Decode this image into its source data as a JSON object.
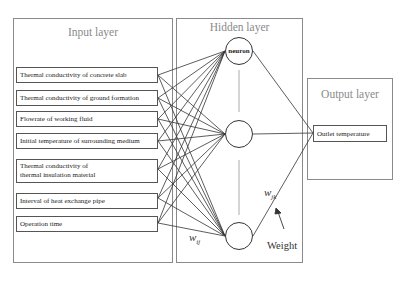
{
  "diagram": {
    "type": "neural-network",
    "layers": {
      "input": {
        "title": "Input layer",
        "nodes": [
          {
            "label": "Thermal conductivity of concrete slab"
          },
          {
            "label": "Thermal conductivity of ground formation"
          },
          {
            "label": "Flowrate of working fluid"
          },
          {
            "label": "Initial temperature of surrounding medium"
          },
          {
            "label": "Thermal conductivity of",
            "label2": "thermal insulation material"
          },
          {
            "label": "Interval of heat exchange pipe"
          },
          {
            "label": "Operation time"
          }
        ]
      },
      "hidden": {
        "title": "Hidden layer",
        "neurons": [
          {
            "label": "neuron"
          },
          {
            "label": ""
          },
          {
            "label": ""
          }
        ]
      },
      "output": {
        "title": "Output layer",
        "nodes": [
          {
            "label": "Outlet temperature"
          }
        ]
      }
    },
    "annotations": {
      "w_ij": "w",
      "w_ij_sub": "ij",
      "w_jk": "w",
      "w_jk_sub": "jk",
      "weight": "Weight"
    },
    "colors": {
      "frame": "#8a8a8a",
      "line": "#333333",
      "title": "#8a8a8a"
    }
  }
}
